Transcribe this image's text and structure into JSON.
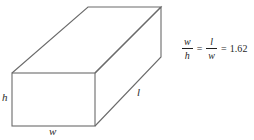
{
  "figure": {
    "name": "rectangular-box-golden-ratio-diagram",
    "background_color": "#ffffff",
    "line_color": "#6b6b6b",
    "text_color": "#222222"
  },
  "solid": {
    "type": "rectangular-box",
    "labels": {
      "height": "h",
      "width": "w",
      "length": "l"
    }
  },
  "equation": {
    "first_fraction": {
      "numerator": "w",
      "denominator": "h"
    },
    "equals_1": "=",
    "second_fraction": {
      "numerator": "l",
      "denominator": "w"
    },
    "equals_2": "=",
    "value": "1.62"
  }
}
